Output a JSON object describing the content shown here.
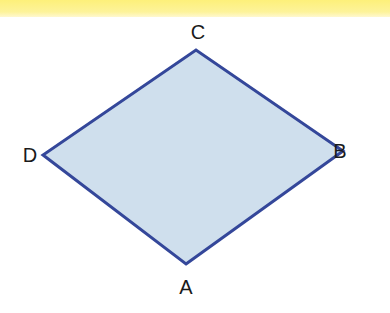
{
  "figure": {
    "shape": "rhombus",
    "fill_color": "#cfdfed",
    "stroke_color": "#34479a",
    "band_color": "#fdf07a",
    "vertices": [
      {
        "label": "A",
        "x": 186,
        "y": 264
      },
      {
        "label": "B",
        "x": 343,
        "y": 151
      },
      {
        "label": "C",
        "x": 196,
        "y": 50
      },
      {
        "label": "D",
        "x": 43,
        "y": 155
      }
    ]
  }
}
